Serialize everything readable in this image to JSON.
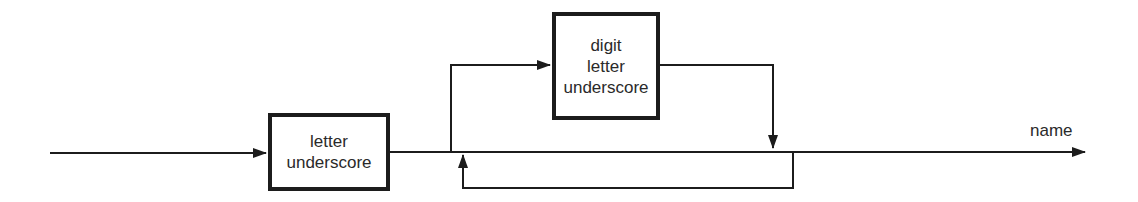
{
  "diagram": {
    "type": "syntax-diagram",
    "output_label": "name",
    "boxes": [
      {
        "id": "first",
        "lines": [
          "letter",
          "underscore"
        ]
      },
      {
        "id": "repeat",
        "lines": [
          "digit",
          "letter",
          "underscore"
        ]
      }
    ],
    "colors": {
      "stroke": "#1c1c1c",
      "text": "#2a2a2a",
      "background": "#ffffff"
    }
  }
}
